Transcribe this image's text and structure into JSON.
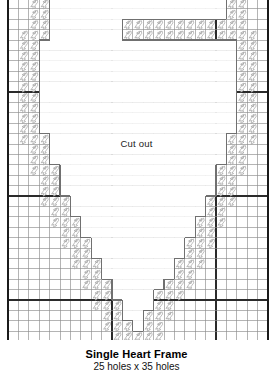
{
  "document": {
    "kind": "cross-stitch-chart",
    "title": "Single Heart Frame",
    "subtitle": "25 holes x 35 holes",
    "cutout_label": "Cut out"
  },
  "grid": {
    "columns": 25,
    "rows": 35,
    "cell_size": 10.4,
    "origin_x": 8,
    "origin_y": -12,
    "bold_every": 10,
    "line_color": "#8c8c8c",
    "bold_line_color": "#2b2b2b",
    "border_color": "#1a1a1a"
  },
  "stitch": {
    "symbol_name": "slanted-stitch-mark",
    "outline_color": "#9a9a9a",
    "fill_color": "#ffffff"
  },
  "heart": {
    "note": "Column ranges of the cut-out interior per grid row (0-indexed, inclusive start, exclusive end). Empty pair means no cut-out on that row.",
    "rows": [
      [
        4,
        21
      ],
      [
        4,
        21
      ],
      [
        4,
        21
      ],
      [
        4,
        11
      ],
      [
        4,
        11
      ],
      [
        3,
        22
      ],
      [
        3,
        22
      ],
      [
        3,
        22
      ],
      [
        3,
        22
      ],
      [
        3,
        22
      ],
      [
        3,
        22
      ],
      [
        3,
        22
      ],
      [
        3,
        22
      ],
      [
        3,
        22
      ],
      [
        4,
        21
      ],
      [
        4,
        21
      ],
      [
        4,
        21
      ],
      [
        5,
        20
      ],
      [
        5,
        20
      ],
      [
        5,
        20
      ],
      [
        6,
        19
      ],
      [
        6,
        19
      ],
      [
        7,
        18
      ],
      [
        7,
        18
      ],
      [
        8,
        17
      ],
      [
        8,
        17
      ],
      [
        9,
        16
      ],
      [
        9,
        16
      ],
      [
        10,
        15
      ],
      [
        10,
        14
      ],
      [
        11,
        14
      ],
      [
        11,
        13
      ],
      [
        12,
        13
      ],
      [],
      []
    ]
  },
  "outline": {
    "stroke_color": "#707070",
    "stroke_width": 1.1
  }
}
